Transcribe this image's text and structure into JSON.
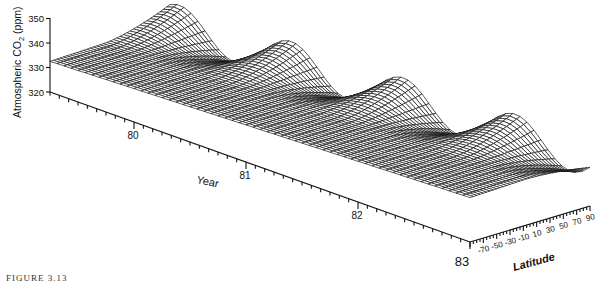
{
  "chart_data": {
    "type": "surface3d",
    "title": "",
    "zlabel": "Atmospheric CO2 (ppm)",
    "zlabel_main": "Atmospheric CO",
    "zlabel_sub": "2",
    "zlabel_unit": " (ppm)",
    "z_ticks": [
      320,
      330,
      340,
      350
    ],
    "zlim": [
      320,
      350
    ],
    "xlabel": "Year",
    "x_ticks": [
      "80",
      "81",
      "82",
      "83"
    ],
    "x_tick_values": [
      1980,
      1981,
      1982,
      1983
    ],
    "xlim": [
      1979.25,
      1983
    ],
    "ylabel": "Latitude",
    "y_ticks": [
      "-70",
      "-50",
      "-30",
      "-10",
      "10",
      "30",
      "50",
      "70",
      "90"
    ],
    "y_tick_values": [
      -70,
      -50,
      -30,
      -10,
      10,
      30,
      50,
      70,
      90
    ],
    "ylim": [
      -90,
      90
    ],
    "surface_model": {
      "description": "Wireframe CO2 surface vs. time and latitude: rising trend with annual seasonal cycle whose amplitude grows toward northern high latitudes",
      "base_ppm_at_start": 334,
      "trend_ppm_per_year": 1.5,
      "south_pole_offset_ppm": -1.5,
      "north_seasonal_amplitude_ppm": 8,
      "peak_month_fraction": 0.33,
      "year_grid_steps": 60,
      "latitude_grid_steps": 36
    }
  },
  "caption": "FIGURE 3.13"
}
